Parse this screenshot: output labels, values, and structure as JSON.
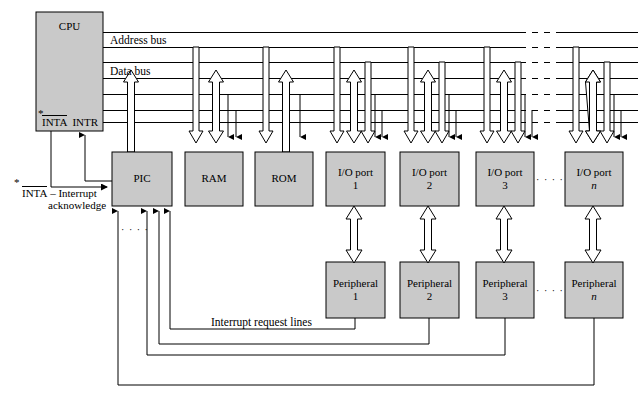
{
  "diagram": {
    "colors": {
      "box_fill": "#c9c9c9",
      "box_stroke": "#000000",
      "line": "#000000",
      "background": "#ffffff"
    },
    "blocks": {
      "cpu": {
        "label": "CPU"
      },
      "pic": {
        "label": "PIC"
      },
      "ram": {
        "label": "RAM"
      },
      "rom": {
        "label": "ROM"
      },
      "io_ports": [
        {
          "label": "I/O port",
          "index": "1"
        },
        {
          "label": "I/O port",
          "index": "2"
        },
        {
          "label": "I/O port",
          "index": "3"
        },
        {
          "label": "I/O port",
          "index": "n"
        }
      ],
      "peripherals": [
        {
          "label": "Peripheral",
          "index": "1"
        },
        {
          "label": "Peripheral",
          "index": "2"
        },
        {
          "label": "Peripheral",
          "index": "3"
        },
        {
          "label": "Peripheral",
          "index": "n"
        }
      ]
    },
    "buses": {
      "address": "Address bus",
      "data": "Data bus"
    },
    "cpu_pins": {
      "inta": "INTA",
      "intr": "INTR",
      "asterisk": "*"
    },
    "footnote": {
      "asterisk": "*",
      "signal": "INTA",
      "dash_text": "– Interrupt",
      "second_line": "acknowledge"
    },
    "annotations": {
      "interrupt_request_lines": "Interrupt request lines",
      "ellipsis": "· · · ·"
    }
  }
}
